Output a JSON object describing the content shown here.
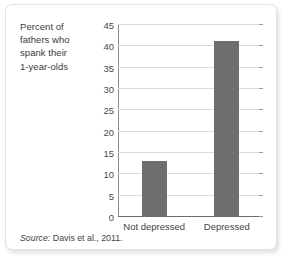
{
  "chart_data": {
    "type": "bar",
    "title": "",
    "subtitle": "",
    "xlabel": "",
    "ylabel": "Percent of fathers who spank their 1-year-olds",
    "ylabel_lines": [
      "Percent of",
      "fathers who",
      "spank their",
      "1-year-olds"
    ],
    "categories": [
      "Not depressed",
      "Depressed"
    ],
    "values": [
      13,
      41
    ],
    "ylim": [
      0,
      45
    ],
    "yticks": [
      0,
      5,
      10,
      15,
      20,
      25,
      30,
      35,
      40,
      45
    ],
    "ytick_labels": [
      "0",
      "5",
      "10",
      "15",
      "20",
      "25",
      "30",
      "35",
      "40",
      "45"
    ],
    "grid": true,
    "legend": false,
    "legend_position": "none",
    "bar_color": "#6e6e6e",
    "gridline_color": "#dcdcdc",
    "axis_color": "#8d8d8d"
  },
  "source": {
    "prefix": "Source:",
    "citation": "Davis et al., 2011."
  }
}
